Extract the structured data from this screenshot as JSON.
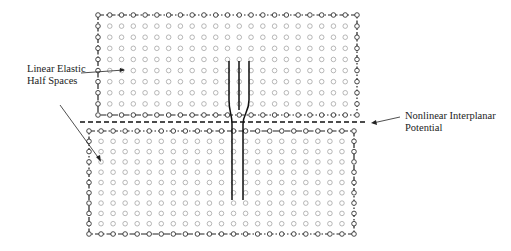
{
  "labels": {
    "left_line1": "Linear Elastic",
    "left_line2": "Half Spaces",
    "right_line1": "Nonlinear Interplanar",
    "right_line2": "Potential"
  },
  "figure": {
    "top_block": {
      "x0": 98,
      "y0": 15,
      "x1": 357,
      "y1": 115,
      "cols": 23,
      "rows": 9
    },
    "bottom_block": {
      "x0": 89,
      "y0": 131,
      "x1": 354,
      "y1": 234,
      "cols": 23,
      "rows": 10
    },
    "interface_y": 122,
    "dislocation_lines_top_x": [
      229,
      239,
      249
    ],
    "dislocation_lines_bottom_x": [
      232,
      243
    ],
    "colors": {
      "atom": "#9a9a9a",
      "line": "#111111",
      "boundary": "#222222"
    }
  }
}
